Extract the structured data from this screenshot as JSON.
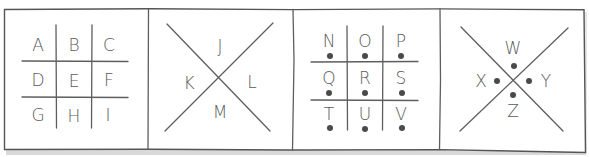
{
  "diagram": {
    "type": "pigpen-cipher-key",
    "colors": {
      "background": "#ffffff",
      "line": "#5e5e5e",
      "text": "#5a5a5a",
      "dot": "#4a4a4a",
      "shadow": "#d6d6d6"
    },
    "panels": [
      {
        "name": "grid-plain",
        "kind": "tic-tac-toe",
        "dotted": false,
        "letters": [
          "A",
          "B",
          "C",
          "D",
          "E",
          "F",
          "G",
          "H",
          "I"
        ]
      },
      {
        "name": "x-plain",
        "kind": "x",
        "dotted": false,
        "letters": {
          "top": "J",
          "left": "K",
          "right": "L",
          "bottom": "M"
        }
      },
      {
        "name": "grid-dotted",
        "kind": "tic-tac-toe",
        "dotted": true,
        "letters": [
          "N",
          "O",
          "P",
          "Q",
          "R",
          "S",
          "T",
          "U",
          "V"
        ]
      },
      {
        "name": "x-dotted",
        "kind": "x",
        "dotted": true,
        "letters": {
          "top": "W",
          "left": "X",
          "right": "Y",
          "bottom": "Z"
        }
      }
    ]
  }
}
